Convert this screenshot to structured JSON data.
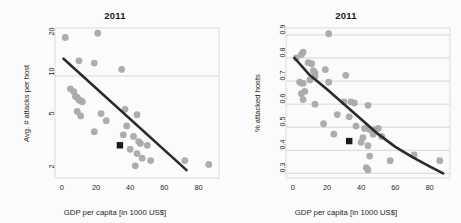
{
  "figure": {
    "background_color": "#fbfbfb",
    "point_color": "#a9a9a9",
    "fit_line_color": "#2b2b2b",
    "grid_color": "#c9c9c9",
    "frame_color": "#d5d5d5",
    "highlight_marker_color": "#1a1a1a"
  },
  "panels": [
    {
      "id": "left",
      "title": "2011",
      "xlabel": "GDP per capita [in 1000 US$]",
      "ylabel": "Avg. # attacks per host",
      "xticks": [
        "0",
        "20",
        "40",
        "60",
        "80"
      ],
      "yticks": [
        "2",
        "5",
        "10",
        "20"
      ]
    },
    {
      "id": "right",
      "title": "2011",
      "xlabel": "GDP per capita [in 1000 US$]",
      "ylabel": "% attacked hosts",
      "xticks": [
        "0",
        "20",
        "40",
        "60",
        "80"
      ],
      "yticks": [
        "0.3",
        "0.4",
        "0.5",
        "0.6",
        "0.7",
        "0.8",
        "0.9"
      ]
    }
  ],
  "chart_data": [
    {
      "type": "scatter",
      "panel": "left",
      "title": "2011",
      "xlabel": "GDP per capita [in 1000 US$]",
      "ylabel": "Avg. # attacks per host",
      "xlim": [
        -4,
        92
      ],
      "ylim": [
        1.7,
        23
      ],
      "yscale": "log",
      "xscale": "linear",
      "xticks": [
        0,
        20,
        40,
        60,
        80
      ],
      "yticks": [
        2,
        5,
        10,
        20
      ],
      "grid": "y-gridline at 10 only",
      "legend": "none",
      "series": [
        {
          "name": "countries",
          "marker": "circle",
          "color": "#a9a9a9",
          "points": [
            {
              "x": 2,
              "y": 19.5
            },
            {
              "x": 21,
              "y": 21.0
            },
            {
              "x": 10,
              "y": 13.0
            },
            {
              "x": 19,
              "y": 12.5
            },
            {
              "x": 35,
              "y": 11.2
            },
            {
              "x": 5,
              "y": 8.0
            },
            {
              "x": 7,
              "y": 7.6
            },
            {
              "x": 8,
              "y": 7.0
            },
            {
              "x": 9,
              "y": 6.9
            },
            {
              "x": 10,
              "y": 6.6
            },
            {
              "x": 11,
              "y": 6.5
            },
            {
              "x": 12,
              "y": 6.4
            },
            {
              "x": 9,
              "y": 5.4
            },
            {
              "x": 11,
              "y": 5.0
            },
            {
              "x": 23,
              "y": 5.2
            },
            {
              "x": 37,
              "y": 5.6
            },
            {
              "x": 44,
              "y": 5.1
            },
            {
              "x": 26,
              "y": 4.6
            },
            {
              "x": 38,
              "y": 4.2
            },
            {
              "x": 19,
              "y": 3.8
            },
            {
              "x": 36,
              "y": 3.6
            },
            {
              "x": 42,
              "y": 3.5
            },
            {
              "x": 45,
              "y": 3.2
            },
            {
              "x": 46,
              "y": 3.1
            },
            {
              "x": 50,
              "y": 3.0
            },
            {
              "x": 40,
              "y": 2.8
            },
            {
              "x": 44,
              "y": 2.6
            },
            {
              "x": 47,
              "y": 2.4
            },
            {
              "x": 52,
              "y": 2.3
            },
            {
              "x": 43,
              "y": 2.1
            },
            {
              "x": 72,
              "y": 2.3
            },
            {
              "x": 86,
              "y": 2.15
            }
          ]
        },
        {
          "name": "highlighted",
          "marker": "square",
          "color": "#1a1a1a",
          "points": [
            {
              "x": 34,
              "y": 3.0
            }
          ]
        }
      ],
      "fit": {
        "kind": "log-linear",
        "description": "straight declining line on log y axis",
        "endpoints": [
          {
            "x": 1,
            "y": 13.5
          },
          {
            "x": 73,
            "y": 1.95
          }
        ]
      }
    },
    {
      "type": "scatter",
      "panel": "right",
      "title": "2011",
      "xlabel": "GDP per capita [in 1000 US$]",
      "ylabel": "% attacked hosts",
      "xlim": [
        -4,
        92
      ],
      "ylim": [
        0.28,
        0.93
      ],
      "yscale": "linear",
      "xscale": "linear",
      "xticks": [
        0,
        20,
        40,
        60,
        80
      ],
      "yticks": [
        0.3,
        0.4,
        0.5,
        0.6,
        0.7,
        0.8,
        0.9
      ],
      "grid": "horizontal gridlines at every y tick",
      "legend": "none",
      "series": [
        {
          "name": "countries",
          "marker": "circle",
          "color": "#a9a9a9",
          "points": [
            {
              "x": 21,
              "y": 0.905
            },
            {
              "x": 2,
              "y": 0.8
            },
            {
              "x": 5,
              "y": 0.815
            },
            {
              "x": 6,
              "y": 0.825
            },
            {
              "x": 9,
              "y": 0.78
            },
            {
              "x": 11,
              "y": 0.775
            },
            {
              "x": 12,
              "y": 0.745
            },
            {
              "x": 13,
              "y": 0.735
            },
            {
              "x": 19,
              "y": 0.75
            },
            {
              "x": 4,
              "y": 0.695
            },
            {
              "x": 6,
              "y": 0.69
            },
            {
              "x": 10,
              "y": 0.705
            },
            {
              "x": 13,
              "y": 0.72
            },
            {
              "x": 21,
              "y": 0.695
            },
            {
              "x": 31,
              "y": 0.725
            },
            {
              "x": 5,
              "y": 0.645
            },
            {
              "x": 7,
              "y": 0.655
            },
            {
              "x": 6,
              "y": 0.62
            },
            {
              "x": 13,
              "y": 0.6
            },
            {
              "x": 30,
              "y": 0.61
            },
            {
              "x": 34,
              "y": 0.61
            },
            {
              "x": 36,
              "y": 0.605
            },
            {
              "x": 44,
              "y": 0.595
            },
            {
              "x": 26,
              "y": 0.555
            },
            {
              "x": 33,
              "y": 0.545
            },
            {
              "x": 18,
              "y": 0.515
            },
            {
              "x": 37,
              "y": 0.505
            },
            {
              "x": 42,
              "y": 0.495
            },
            {
              "x": 45,
              "y": 0.49
            },
            {
              "x": 48,
              "y": 0.49
            },
            {
              "x": 50,
              "y": 0.495
            },
            {
              "x": 24,
              "y": 0.47
            },
            {
              "x": 41,
              "y": 0.455
            },
            {
              "x": 47,
              "y": 0.47
            },
            {
              "x": 52,
              "y": 0.46
            },
            {
              "x": 40,
              "y": 0.435
            },
            {
              "x": 44,
              "y": 0.42
            },
            {
              "x": 45,
              "y": 0.375
            },
            {
              "x": 57,
              "y": 0.355
            },
            {
              "x": 71,
              "y": 0.38
            },
            {
              "x": 86,
              "y": 0.355
            },
            {
              "x": 43,
              "y": 0.325
            },
            {
              "x": 44,
              "y": 0.315
            }
          ]
        },
        {
          "name": "highlighted",
          "marker": "square",
          "color": "#1a1a1a",
          "points": [
            {
              "x": 33,
              "y": 0.44
            }
          ]
        }
      ],
      "fit": {
        "kind": "decaying-curve",
        "description": "smooth convex declining curve",
        "samples": [
          {
            "x": 1,
            "y": 0.8
          },
          {
            "x": 10,
            "y": 0.725
          },
          {
            "x": 20,
            "y": 0.665
          },
          {
            "x": 30,
            "y": 0.6
          },
          {
            "x": 40,
            "y": 0.535
          },
          {
            "x": 50,
            "y": 0.47
          },
          {
            "x": 60,
            "y": 0.415
          },
          {
            "x": 70,
            "y": 0.37
          },
          {
            "x": 80,
            "y": 0.33
          },
          {
            "x": 88,
            "y": 0.3
          }
        ]
      }
    }
  ]
}
